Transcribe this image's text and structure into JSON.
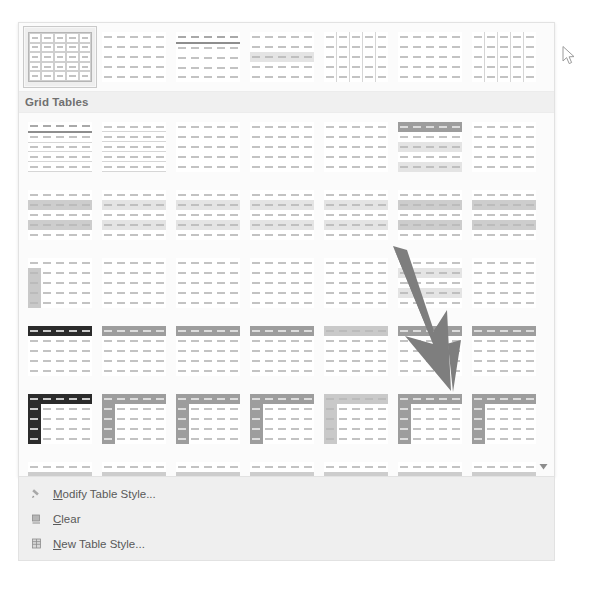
{
  "gallery": {
    "name": "Table Styles gallery",
    "scroll_down_icon": "chevron-down-icon",
    "sections": [
      {
        "id": "plain-tables",
        "header": "",
        "header_visible": false,
        "rows": [
          {
            "thumbs": [
              {
                "name": "Table Grid",
                "variant": "grid-full",
                "selected": true
              },
              {
                "name": "Plain Table 1",
                "variant": "plain",
                "selected": false
              },
              {
                "name": "Plain Table 2",
                "variant": "plain-hdr",
                "selected": false
              },
              {
                "name": "Plain Table 3",
                "variant": "plain-band",
                "selected": false
              },
              {
                "name": "Plain Table 4",
                "variant": "plain-firstline",
                "selected": false
              },
              {
                "name": "Plain Table 5",
                "variant": "plain-sparse",
                "selected": false
              },
              {
                "name": "Table Grid Light",
                "variant": "plain-firstline",
                "selected": false
              }
            ]
          }
        ]
      },
      {
        "id": "grid-tables",
        "header": "Grid Tables",
        "header_visible": true,
        "rows": [
          {
            "thumbs": [
              {
                "name": "Grid Table 1 Light",
                "variant": "grid-light-hdr",
                "selected": false
              },
              {
                "name": "Grid Table 2",
                "variant": "hline",
                "selected": false
              },
              {
                "name": "Grid Table 3",
                "variant": "plain",
                "selected": false
              },
              {
                "name": "Grid Table 4",
                "variant": "plain",
                "selected": false
              },
              {
                "name": "Grid Table 5 Dark",
                "variant": "plain",
                "selected": false
              },
              {
                "name": "Grid Table 6 Colorful",
                "variant": "hdr-light-band",
                "selected": false
              },
              {
                "name": "Grid Table 7 Colorful",
                "variant": "plain",
                "selected": false
              }
            ]
          },
          {
            "thumbs": [
              {
                "name": "Grid Table 1 Light - Accent 1",
                "variant": "band-heavy",
                "selected": false
              },
              {
                "name": "Grid Table 2 - Accent 1",
                "variant": "band-light",
                "selected": false
              },
              {
                "name": "Grid Table 3 - Accent 1",
                "variant": "band-light",
                "selected": false
              },
              {
                "name": "Grid Table 4 - Accent 1",
                "variant": "band-light",
                "selected": false
              },
              {
                "name": "Grid Table 5 Dark - Accent 1",
                "variant": "band-light",
                "selected": false
              },
              {
                "name": "Grid Table 6 Colorful - Accent 1",
                "variant": "band-heavy",
                "selected": false
              },
              {
                "name": "Grid Table 7 Colorful - Accent 1",
                "variant": "band-heavy",
                "selected": false
              }
            ]
          },
          {
            "thumbs": [
              {
                "name": "Grid Table 1 Light - Accent 2",
                "variant": "firstcol-light",
                "selected": false
              },
              {
                "name": "Grid Table 2 - Accent 2",
                "variant": "plain",
                "selected": false
              },
              {
                "name": "Grid Table 3 - Accent 2",
                "variant": "plain",
                "selected": false
              },
              {
                "name": "Grid Table 4 - Accent 2",
                "variant": "plain",
                "selected": false
              },
              {
                "name": "Grid Table 5 Dark - Accent 2",
                "variant": "plain",
                "selected": false
              },
              {
                "name": "Grid Table 6 Colorful - Accent 2",
                "variant": "band-light",
                "selected": false
              },
              {
                "name": "Grid Table 7 Colorful - Accent 2",
                "variant": "plain",
                "selected": false
              }
            ]
          },
          {
            "thumbs": [
              {
                "name": "Grid Table 4 - Accent 3",
                "variant": "hdr-dark",
                "selected": false
              },
              {
                "name": "Grid Table 4 - Accent 4",
                "variant": "hdr-grey",
                "selected": false
              },
              {
                "name": "Grid Table 4 - Accent 5",
                "variant": "hdr-grey",
                "selected": false
              },
              {
                "name": "Grid Table 4 - Accent 6",
                "variant": "hdr-grey",
                "selected": false
              },
              {
                "name": "Grid Table 5 Dark - Accent 3",
                "variant": "hdr-lgrey",
                "selected": false
              },
              {
                "name": "Grid Table 5 Dark - Accent 4",
                "variant": "hdr-grey",
                "selected": false
              },
              {
                "name": "Grid Table 5 Dark - Accent 5",
                "variant": "hdr-grey",
                "selected": false
              }
            ]
          },
          {
            "thumbs": [
              {
                "name": "Grid Table 6 Colorful - Accent 3",
                "variant": "hdr-dark-firstcol-dark",
                "selected": false
              },
              {
                "name": "Grid Table 6 Colorful - Accent 4",
                "variant": "hdr-grey-firstcol-grey",
                "selected": false
              },
              {
                "name": "Grid Table 6 Colorful - Accent 5",
                "variant": "hdr-grey-firstcol-grey",
                "selected": false
              },
              {
                "name": "Grid Table 6 Colorful - Accent 6",
                "variant": "hdr-grey-firstcol-grey",
                "selected": false
              },
              {
                "name": "Grid Table 7 Colorful - Accent 3",
                "variant": "firstcol-lgrey",
                "selected": false
              },
              {
                "name": "Grid Table 7 Colorful - Accent 4",
                "variant": "hdr-grey-firstcol-grey",
                "selected": false
              },
              {
                "name": "Grid Table 7 Colorful - Accent 5",
                "variant": "hdr-grey-firstcol-grey",
                "selected": false
              }
            ]
          },
          {
            "thumbs": [
              {
                "name": "List Table 1 Light",
                "variant": "band-heavy",
                "selected": false
              },
              {
                "name": "List Table 2",
                "variant": "band-heavy",
                "selected": false
              },
              {
                "name": "List Table 3",
                "variant": "band-heavy",
                "selected": false
              },
              {
                "name": "List Table 4",
                "variant": "band-heavy",
                "selected": false
              },
              {
                "name": "List Table 5 Dark",
                "variant": "band-heavy",
                "selected": false
              },
              {
                "name": "List Table 6 Colorful",
                "variant": "band-heavy",
                "selected": false
              },
              {
                "name": "List Table 7 Colorful",
                "variant": "band-heavy",
                "selected": false
              }
            ]
          }
        ]
      }
    ]
  },
  "commands": [
    {
      "icon": "brush-icon",
      "label_prefix": "",
      "label_accel": "M",
      "label_rest": "odify Table Style...",
      "label": "Modify Table Style..."
    },
    {
      "icon": "eraser-icon",
      "label_prefix": "",
      "label_accel": "C",
      "label_rest": "lear",
      "label": "Clear"
    },
    {
      "icon": "new-table-icon",
      "label_prefix": "",
      "label_accel": "N",
      "label_rest": "ew Table Style...",
      "label": "New Table Style..."
    }
  ],
  "cursor": {
    "name": "mouse-pointer",
    "x": 562,
    "y": 46
  },
  "annotation": {
    "name": "pointer-arrow",
    "color": "#7e7e7e",
    "points_to": "Grid Table 7 Colorful - Accent 5"
  },
  "colors": {
    "panel_bg": "#fbfbfb",
    "panel_border": "#e2e2e2",
    "section_header_bg": "#f0f0f0",
    "section_header_text": "#707070",
    "commands_bg": "#efefef",
    "command_text": "#595959",
    "selected_thumb_bg": "#eeeeee",
    "annotation_arrow": "#7e7e7e"
  }
}
